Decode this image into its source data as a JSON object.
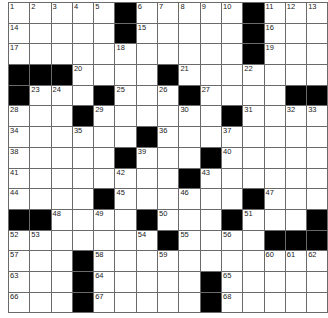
{
  "puzzle": {
    "rows": 15,
    "cols": 15,
    "colors": {
      "block": "#000000",
      "cell": "#ffffff",
      "line": "#6a6a6a",
      "number": "#222222"
    },
    "grid": [
      "11111011111011 1",
      "x"
    ],
    "layout": [
      "#####.#####.###",
      "x"
    ],
    "cells": [
      [
        "1",
        "2",
        "3",
        "4",
        "5",
        "#",
        "6",
        "7",
        "8",
        "9",
        "10",
        "#",
        "11",
        "12",
        "13"
      ],
      [
        "14",
        "",
        "",
        "",
        "",
        "#",
        "15",
        "",
        "",
        "",
        "",
        "#",
        "16",
        "",
        ""
      ],
      [
        "17",
        "",
        "",
        "",
        "",
        "18",
        "",
        "",
        "",
        "",
        "",
        "#",
        "19",
        "",
        ""
      ],
      [
        "#",
        "#",
        "#",
        "20",
        "",
        "",
        "",
        "#",
        "21",
        "",
        "",
        "22",
        "",
        "",
        ""
      ],
      [
        "#",
        "23",
        "24",
        "",
        "#",
        "25",
        "",
        "26",
        "#",
        "27",
        "",
        "",
        "",
        "#",
        "#"
      ],
      [
        "28",
        "",
        "",
        "#",
        "29",
        "",
        "",
        "",
        "30",
        "",
        "#",
        "31",
        "",
        "32",
        "33"
      ],
      [
        "34",
        "",
        "",
        "35",
        "",
        "",
        "#",
        "36",
        "",
        "",
        "37",
        "",
        "",
        "",
        ""
      ],
      [
        "38",
        "",
        "",
        "",
        "",
        "#",
        "39",
        "",
        "",
        "#",
        "40",
        "",
        "",
        "",
        ""
      ],
      [
        "41",
        "",
        "",
        "",
        "",
        "42",
        "",
        "",
        "#",
        "43",
        "",
        "",
        "",
        "",
        ""
      ],
      [
        "44",
        "",
        "",
        "",
        "#",
        "45",
        "",
        "",
        "46",
        "",
        "",
        "#",
        "47",
        "",
        ""
      ],
      [
        "#",
        "#",
        "48",
        "",
        "49",
        "",
        "#",
        "50",
        "",
        "",
        "#",
        "51",
        "",
        "",
        "#"
      ],
      [
        "52",
        "53",
        "",
        "",
        "",
        "",
        "54",
        "#",
        "55",
        "",
        "56",
        "",
        "#",
        "#",
        "#"
      ],
      [
        "57",
        "",
        "",
        "#",
        "58",
        "",
        "",
        "59",
        "",
        "",
        "",
        "",
        "60",
        "61",
        "62"
      ],
      [
        "63",
        "",
        "",
        "#",
        "64",
        "",
        "",
        "",
        "",
        "#",
        "65",
        "",
        "",
        "",
        ""
      ],
      [
        "66",
        "",
        "",
        "#",
        "67",
        "",
        "",
        "",
        "",
        "#",
        "68",
        "",
        "",
        "",
        ""
      ]
    ]
  }
}
